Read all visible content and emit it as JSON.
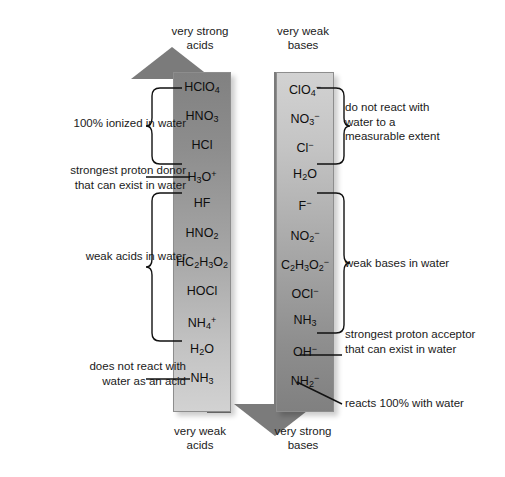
{
  "diagram": {
    "captions": {
      "acid_top": "very strong\nacids",
      "acid_top_line1": "very strong",
      "acid_top_line2": "acids",
      "base_top_line1": "very weak",
      "base_top_line2": "bases",
      "acid_bottom_line1": "very weak",
      "acid_bottom_line2": "acids",
      "base_bottom_line1": "very strong",
      "base_bottom_line2": "bases"
    },
    "colors": {
      "arrow_dark": "#7b7b7b",
      "arrow_light": "#d2d2d2",
      "text": "#111111",
      "background": "#ffffff"
    },
    "acids": [
      {
        "formula": "HClO",
        "sub": "4",
        "sup": ""
      },
      {
        "formula": "HNO",
        "sub": "3",
        "sup": ""
      },
      {
        "formula": "HCl",
        "sub": "",
        "sup": ""
      },
      {
        "formula": "H",
        "sub": "3",
        "sup": "+",
        "tail": "O"
      },
      {
        "formula": "HF",
        "sub": "",
        "sup": ""
      },
      {
        "formula": "HNO",
        "sub": "2",
        "sup": ""
      },
      {
        "formula": "HC",
        "sub": "2",
        "sup": "",
        "tail": "H",
        "sub2": "3",
        "tail2": "O",
        "sub3": "2"
      },
      {
        "formula": "HOCl",
        "sub": "",
        "sup": ""
      },
      {
        "formula": "NH",
        "sub": "4",
        "sup": "+"
      },
      {
        "formula": "H",
        "sub": "2",
        "sup": "",
        "tail": "O"
      },
      {
        "formula": "NH",
        "sub": "3",
        "sup": ""
      }
    ],
    "acids_html": [
      "HClO<sub>4</sub>",
      "HNO<sub>3</sub>",
      "HCl",
      "H<sub>3</sub>O<sup>+</sup>",
      "HF",
      "HNO<sub>2</sub>",
      "HC<sub>2</sub>H<sub>3</sub>O<sub>2</sub>",
      "HOCl",
      "NH<sub>4</sub><sup>+</sup>",
      "H<sub>2</sub>O",
      "NH<sub>3</sub>"
    ],
    "bases_html": [
      "ClO<sub>4</sub><sup>&minus;</sup>",
      "NO<sub>3</sub><sup>&minus;</sup>",
      "Cl<sup>&minus;</sup>",
      "H<sub>2</sub>O",
      "F<sup>&minus;</sup>",
      "NO<sub>2</sub><sup>&minus;</sup>",
      "C<sub>2</sub>H<sub>3</sub>O<sub>2</sub><sup>&minus;</sup>",
      "OCl<sup>&minus;</sup>",
      "NH<sub>3</sub>",
      "OH<sup>&minus;</sup>",
      "NH<sub>2</sub><sup>&minus;</sup>"
    ],
    "acids_plain": [
      "HClO4",
      "HNO3",
      "HCl",
      "H3O+",
      "HF",
      "HNO2",
      "HC2H3O2",
      "HOCl",
      "NH4+",
      "H2O",
      "NH3"
    ],
    "bases_plain": [
      "ClO4-",
      "NO3-",
      "Cl-",
      "H2O",
      "F-",
      "NO2-",
      "C2H3O2-",
      "OCl-",
      "NH3",
      "OH-",
      "NH2-"
    ],
    "notes": {
      "left_100_ionized": "100% ionized in water",
      "left_strongest_donor_line1": "strongest proton donor",
      "left_strongest_donor_line2": "that can exist in water",
      "left_weak_acids": "weak acids in water",
      "left_no_react_line1": "does not react with",
      "left_no_react_line2": "water as an acid",
      "right_no_react_line1": "do not react with",
      "right_no_react_line2": "water to a",
      "right_no_react_line3": "measurable extent",
      "right_weak_bases": "weak bases in water",
      "right_strongest_acceptor_line1": "strongest proton acceptor",
      "right_strongest_acceptor_line2": "that can exist in water",
      "right_reacts_100": "reacts 100% with water"
    }
  }
}
